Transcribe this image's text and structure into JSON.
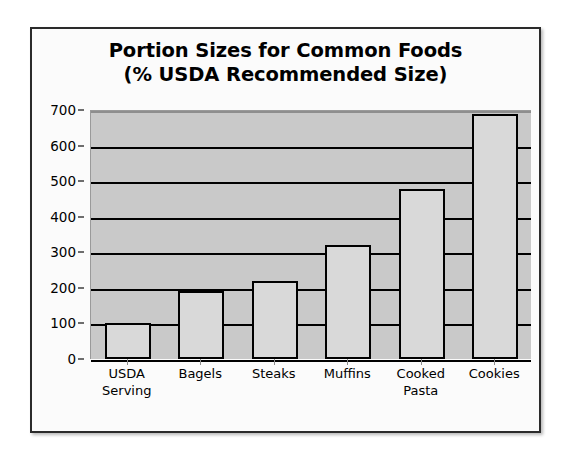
{
  "chart_data": {
    "type": "bar",
    "title": "Portion Sizes for Common Foods\n(% USDA Recommended Size)",
    "title_line1": "Portion Sizes for Common Foods",
    "title_line2": "(% USDA Recommended Size)",
    "categories": [
      "USDA\nServing",
      "Bagels",
      "Steaks",
      "Muffins",
      "Cooked\nPasta",
      "Cookies"
    ],
    "values": [
      100,
      190,
      220,
      320,
      478,
      690
    ],
    "xlabel": "",
    "ylabel": "",
    "ylim": [
      0,
      700
    ],
    "ytick_labels": [
      "700",
      "600",
      "500",
      "400",
      "300",
      "200",
      "100",
      "0"
    ],
    "ytick_values": [
      700,
      600,
      500,
      400,
      300,
      200,
      100,
      0
    ],
    "grid": true,
    "legend": "none",
    "colors": {
      "bar_fill": "#d9d9d9",
      "bar_border": "#000000",
      "plot_background": "#c9c9c9",
      "chart_background": "#fbfbfb",
      "frame_border": "#2b2b2b",
      "gridline": "#000000",
      "text": "#000000"
    }
  }
}
